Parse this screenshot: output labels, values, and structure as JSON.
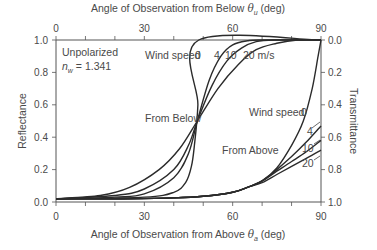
{
  "chart_data": {
    "type": "line",
    "title": "",
    "top_xlabel": "Angle of Observation from Below",
    "top_xlabel_symbol": "θ",
    "top_xlabel_sub": "u",
    "top_xlabel_unit": "(deg)",
    "xlabel": "Angle of Observation from Above",
    "xlabel_symbol": "θ",
    "xlabel_sub": "a",
    "xlabel_unit": "(deg)",
    "ylabel": "Reflectance",
    "y2label": "Transmittance",
    "xlim": [
      0,
      90
    ],
    "ylim": [
      0,
      1
    ],
    "y2lim": [
      1,
      0
    ],
    "x_ticks": [
      "0",
      "30",
      "60",
      "90"
    ],
    "top_x_ticks": [
      "0",
      "30",
      "60",
      "90"
    ],
    "y_ticks": [
      "0.0",
      "0.2",
      "0.4",
      "0.6",
      "0.8",
      "1.0"
    ],
    "y2_ticks": [
      "0.0",
      "0.2",
      "0.4",
      "0.6",
      "0.8",
      "1.0"
    ],
    "grid": false,
    "annotations": {
      "polarization": "Unpolarized",
      "refractive_index_symbol": "n",
      "refractive_index_sub": "w",
      "refractive_index_value": "= 1.341",
      "from_below": "From Below",
      "from_above": "From Above",
      "wind_speed_top": "Wind speed",
      "wind_speed_top_values": [
        "0",
        "4",
        "10",
        "20 m/s"
      ],
      "wind_speed_right": "Wind speed",
      "wind_speed_right_values": [
        "0",
        "4",
        "10",
        "20"
      ]
    },
    "series": [
      {
        "name": "From Below, 0 m/s",
        "group": "below",
        "x": [
          0,
          30,
          40,
          44,
          46,
          47,
          48.2,
          48.5,
          90
        ],
        "y": [
          0.02,
          0.03,
          0.06,
          0.12,
          0.22,
          0.35,
          0.6,
          1.0,
          1.0
        ]
      },
      {
        "name": "From Below, 4 m/s",
        "group": "below",
        "x": [
          0,
          20,
          30,
          40,
          45,
          48,
          52,
          56,
          60,
          65,
          70,
          90
        ],
        "y": [
          0.02,
          0.03,
          0.05,
          0.15,
          0.3,
          0.5,
          0.75,
          0.9,
          0.97,
          0.995,
          1.0,
          1.0
        ]
      },
      {
        "name": "From Below, 10 m/s",
        "group": "below",
        "x": [
          0,
          20,
          30,
          40,
          45,
          48,
          53,
          58,
          63,
          68,
          75,
          90
        ],
        "y": [
          0.02,
          0.04,
          0.08,
          0.2,
          0.35,
          0.5,
          0.72,
          0.87,
          0.95,
          0.99,
          1.0,
          1.0
        ]
      },
      {
        "name": "From Below, 20 m/s",
        "group": "below",
        "x": [
          0,
          15,
          25,
          35,
          42,
          48,
          55,
          62,
          68,
          75,
          82,
          90
        ],
        "y": [
          0.02,
          0.04,
          0.09,
          0.2,
          0.33,
          0.5,
          0.7,
          0.85,
          0.94,
          0.98,
          1.0,
          1.0
        ]
      },
      {
        "name": "From Above, 0 m/s",
        "group": "above",
        "x": [
          0,
          20,
          40,
          50,
          60,
          65,
          70,
          75,
          80,
          84,
          87,
          89,
          90
        ],
        "y": [
          0.02,
          0.02,
          0.025,
          0.035,
          0.06,
          0.09,
          0.13,
          0.21,
          0.35,
          0.5,
          0.7,
          0.9,
          1.0
        ]
      },
      {
        "name": "From Above, 4 m/s",
        "group": "above",
        "x": [
          0,
          20,
          40,
          50,
          60,
          65,
          70,
          75,
          80,
          85,
          90
        ],
        "y": [
          0.02,
          0.02,
          0.025,
          0.035,
          0.06,
          0.09,
          0.13,
          0.2,
          0.28,
          0.37,
          0.47
        ]
      },
      {
        "name": "From Above, 10 m/s",
        "group": "above",
        "x": [
          0,
          20,
          40,
          50,
          60,
          65,
          70,
          75,
          80,
          85,
          90
        ],
        "y": [
          0.02,
          0.02,
          0.025,
          0.035,
          0.06,
          0.09,
          0.13,
          0.19,
          0.25,
          0.31,
          0.38
        ]
      },
      {
        "name": "From Above, 20 m/s",
        "group": "above",
        "x": [
          0,
          20,
          40,
          50,
          60,
          65,
          70,
          75,
          80,
          85,
          90
        ],
        "y": [
          0.02,
          0.02,
          0.025,
          0.035,
          0.06,
          0.09,
          0.12,
          0.17,
          0.22,
          0.27,
          0.32
        ]
      }
    ]
  }
}
